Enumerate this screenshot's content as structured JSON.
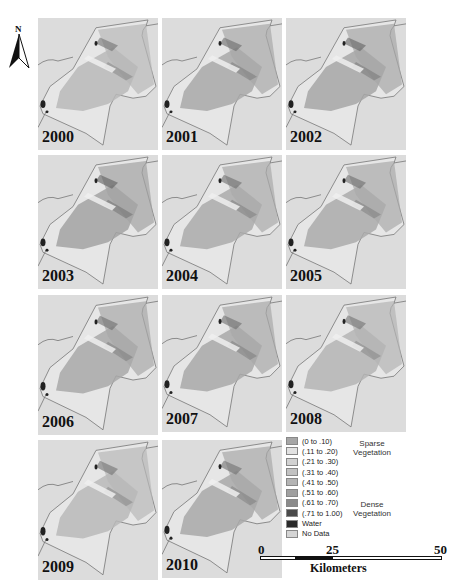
{
  "north_arrow": {
    "label": "N"
  },
  "panels": [
    {
      "year": "2000",
      "x": 38,
      "y": 18,
      "w": 120,
      "h": 132,
      "tone": "#b8b8b8",
      "dark": 0.1
    },
    {
      "year": "2001",
      "x": 162,
      "y": 18,
      "w": 120,
      "h": 132,
      "tone": "#a8a8a8",
      "dark": 0.25
    },
    {
      "year": "2002",
      "x": 286,
      "y": 18,
      "w": 120,
      "h": 132,
      "tone": "#a6a6a6",
      "dark": 0.35
    },
    {
      "year": "2003",
      "x": 38,
      "y": 155,
      "w": 120,
      "h": 134,
      "tone": "#a2a2a2",
      "dark": 0.45
    },
    {
      "year": "2004",
      "x": 162,
      "y": 155,
      "w": 120,
      "h": 134,
      "tone": "#aaaaaa",
      "dark": 0.2
    },
    {
      "year": "2005",
      "x": 286,
      "y": 155,
      "w": 120,
      "h": 134,
      "tone": "#aaaaaa",
      "dark": 0.2
    },
    {
      "year": "2006",
      "x": 38,
      "y": 295,
      "w": 120,
      "h": 140,
      "tone": "#a8a8a8",
      "dark": 0.2
    },
    {
      "year": "2007",
      "x": 162,
      "y": 295,
      "w": 120,
      "h": 137,
      "tone": "#a8a8a8",
      "dark": 0.2
    },
    {
      "year": "2008",
      "x": 286,
      "y": 295,
      "w": 120,
      "h": 137,
      "tone": "#b4b4b4",
      "dark": 0.1
    },
    {
      "year": "2009",
      "x": 38,
      "y": 440,
      "w": 120,
      "h": 140,
      "tone": "#b8b8b8",
      "dark": 0.1
    },
    {
      "year": "2010",
      "x": 162,
      "y": 440,
      "w": 120,
      "h": 138,
      "tone": "#a8a8a8",
      "dark": 0.15
    }
  ],
  "legend": {
    "items": [
      {
        "label": "(0 to .10)",
        "color": "#a6a6a6"
      },
      {
        "label": "(.11 to .20)",
        "color": "#e2e2e2"
      },
      {
        "label": "(.21 to .30)",
        "color": "#d2d2d2"
      },
      {
        "label": "(.31 to .40)",
        "color": "#c2c2c2"
      },
      {
        "label": "(.41 to .50)",
        "color": "#b4b4b4"
      },
      {
        "label": "(.51 to .60)",
        "color": "#a0a0a0"
      },
      {
        "label": "(.61 to .70)",
        "color": "#8a8a8a"
      },
      {
        "label": "(.71 to 1.00)",
        "color": "#4a4a4a"
      },
      {
        "label": "Water",
        "color": "#2a2a2a"
      },
      {
        "label": "No Data",
        "color": "#d4d4d4"
      }
    ],
    "groups": [
      {
        "label_line1": "Sparse",
        "label_line2": "Vegetation"
      },
      {
        "label_line1": "Dense",
        "label_line2": "Vegetation"
      }
    ]
  },
  "scale_bar": {
    "ticks": [
      "0",
      "25",
      "50"
    ],
    "unit": "Kilometers"
  }
}
